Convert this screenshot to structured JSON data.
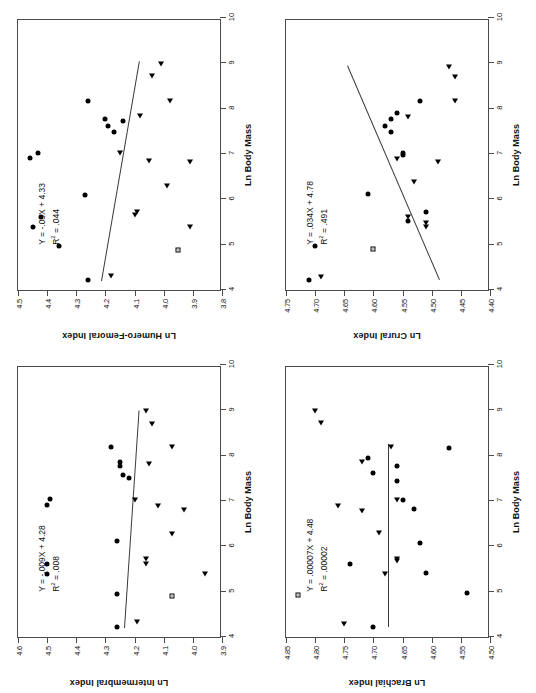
{
  "figure": {
    "background": "#ffffff",
    "ink": "#000000",
    "panel_count": 4,
    "orientation": "rotated-90-ccw"
  },
  "chart_data": [
    {
      "id": "humero-femoral",
      "type": "scatter",
      "position": "top-left",
      "title": "",
      "xlabel": "Ln Body Mass",
      "ylabel": "Ln Humero-Femoral Index",
      "xlim": [
        4,
        10
      ],
      "ylim": [
        3.8,
        4.5
      ],
      "xticks": [
        "4",
        "5",
        "6",
        "7",
        "8",
        "9",
        "10"
      ],
      "yticks": [
        "4.5",
        "4.4",
        "4.3",
        "4.2",
        "4.1",
        "4.0",
        "3.9",
        "3.8"
      ],
      "grid": false,
      "legend": "none",
      "equation": "Y = -.03X + 4.33",
      "r2_label": "R",
      "r2_sup": "2",
      "r2_value": " = .044",
      "fit": {
        "slope": -0.03,
        "intercept": 4.33,
        "r2": 0.044,
        "x_start": 4.2,
        "x_end": 9.05
      },
      "series": [
        {
          "name": "circle",
          "marker": "circle",
          "points": [
            [
              4.23,
              4.26
            ],
            [
              4.97,
              4.36
            ],
            [
              5.38,
              4.45
            ],
            [
              5.62,
              4.42
            ],
            [
              6.1,
              4.27
            ],
            [
              6.92,
              4.46
            ],
            [
              7.03,
              4.43
            ],
            [
              7.48,
              4.17
            ],
            [
              7.62,
              4.19
            ],
            [
              7.78,
              4.2
            ],
            [
              8.18,
              4.26
            ],
            [
              7.72,
              4.14
            ]
          ]
        },
        {
          "name": "triangle",
          "marker": "triangle",
          "points": [
            [
              4.3,
              4.18
            ],
            [
              5.38,
              3.91
            ],
            [
              5.66,
              4.1
            ],
            [
              5.72,
              4.09
            ],
            [
              6.3,
              3.99
            ],
            [
              6.82,
              3.91
            ],
            [
              6.85,
              4.05
            ],
            [
              7.03,
              4.15
            ],
            [
              7.83,
              4.08
            ],
            [
              8.18,
              3.98
            ],
            [
              8.72,
              4.04
            ],
            [
              8.98,
              4.01
            ]
          ]
        },
        {
          "name": "square",
          "marker": "square",
          "points": [
            [
              4.88,
              3.95
            ]
          ]
        }
      ]
    },
    {
      "id": "crural",
      "type": "scatter",
      "position": "top-right",
      "title": "",
      "xlabel": "Ln Body Mass",
      "ylabel": "Ln Crural Index",
      "xlim": [
        4,
        10
      ],
      "ylim": [
        4.4,
        4.75
      ],
      "xticks": [
        "4",
        "5",
        "6",
        "7",
        "8",
        "9",
        "10"
      ],
      "yticks": [
        "4.75",
        "4.70",
        "4.65",
        "4.60",
        "4.55",
        "4.50",
        "4.45",
        "4.40"
      ],
      "grid": false,
      "legend": "none",
      "equation": "Y = .034X + 4.78",
      "r2_label": "R",
      "r2_sup": "2",
      "r2_value": " = .491",
      "fit": {
        "slope": 0.034,
        "intercept": 4.78,
        "r2": 0.491,
        "x_start": 4.22,
        "x_end": 8.95
      },
      "series": [
        {
          "name": "circle",
          "marker": "circle",
          "points": [
            [
              4.22,
              4.71
            ],
            [
              4.98,
              4.7
            ],
            [
              5.52,
              4.54
            ],
            [
              5.72,
              4.51
            ],
            [
              6.12,
              4.61
            ],
            [
              6.98,
              4.55
            ],
            [
              7.03,
              4.55
            ],
            [
              7.48,
              4.57
            ],
            [
              7.62,
              4.58
            ],
            [
              7.78,
              4.57
            ],
            [
              8.18,
              4.52
            ],
            [
              7.9,
              4.56
            ]
          ]
        },
        {
          "name": "triangle",
          "marker": "triangle",
          "points": [
            [
              4.28,
              4.69
            ],
            [
              5.38,
              4.51
            ],
            [
              5.48,
              4.51
            ],
            [
              5.62,
              4.54
            ],
            [
              6.38,
              4.53
            ],
            [
              6.82,
              4.49
            ],
            [
              6.9,
              4.56
            ],
            [
              7.82,
              4.54
            ],
            [
              8.18,
              4.46
            ],
            [
              8.7,
              4.46
            ],
            [
              8.92,
              4.47
            ]
          ]
        },
        {
          "name": "square",
          "marker": "square",
          "points": [
            [
              4.9,
              4.6
            ]
          ]
        }
      ]
    },
    {
      "id": "intermembral",
      "type": "scatter",
      "position": "bottom-left",
      "title": "",
      "xlabel": "Ln Body Mass",
      "ylabel": "Ln Intermembral Index",
      "xlim": [
        4,
        10
      ],
      "ylim": [
        3.9,
        4.6
      ],
      "xticks": [
        "4",
        "5",
        "6",
        "7",
        "8",
        "9",
        "10"
      ],
      "yticks": [
        "4.6",
        "4.5",
        "4.4",
        "4.3",
        "4.2",
        "4.1",
        "4.0",
        "3.9"
      ],
      "grid": false,
      "legend": "none",
      "equation": "Y = -.009X + 4.28",
      "r2_label": "R",
      "r2_sup": "2",
      "r2_value": " = .008",
      "fit": {
        "slope": -0.009,
        "intercept": 4.28,
        "r2": 0.008,
        "x_start": 4.2,
        "x_end": 9.0
      },
      "series": [
        {
          "name": "circle",
          "marker": "circle",
          "points": [
            [
              4.22,
              4.26
            ],
            [
              4.95,
              4.26
            ],
            [
              5.38,
              4.5
            ],
            [
              5.62,
              4.5
            ],
            [
              6.12,
              4.26
            ],
            [
              6.92,
              4.5
            ],
            [
              7.05,
              4.49
            ],
            [
              7.5,
              4.22
            ],
            [
              7.58,
              4.24
            ],
            [
              7.78,
              4.25
            ],
            [
              7.85,
              4.25
            ],
            [
              8.2,
              4.28
            ]
          ]
        },
        {
          "name": "triangle",
          "marker": "triangle",
          "points": [
            [
              4.32,
              4.19
            ],
            [
              5.4,
              3.96
            ],
            [
              5.62,
              4.16
            ],
            [
              5.72,
              4.16
            ],
            [
              6.28,
              4.07
            ],
            [
              6.8,
              4.03
            ],
            [
              6.88,
              4.12
            ],
            [
              7.03,
              4.2
            ],
            [
              7.82,
              4.15
            ],
            [
              8.2,
              4.07
            ],
            [
              8.7,
              4.14
            ],
            [
              8.98,
              4.16
            ]
          ]
        },
        {
          "name": "square",
          "marker": "square",
          "points": [
            [
              4.9,
              4.07
            ]
          ]
        }
      ]
    },
    {
      "id": "brachial",
      "type": "scatter",
      "position": "bottom-right",
      "title": "",
      "xlabel": "Ln Body Mass",
      "ylabel": "Ln Brachial Index",
      "xlim": [
        4,
        10
      ],
      "ylim": [
        4.5,
        4.85
      ],
      "xticks": [
        "4",
        "5",
        "6",
        "7",
        "8",
        "9",
        "10"
      ],
      "yticks": [
        "4.85",
        "4.80",
        "4.75",
        "4.70",
        "4.65",
        "4.60",
        "4.55",
        "4.50"
      ],
      "grid": false,
      "legend": "none",
      "equation": "Y = .00007X + 4.48",
      "r2_label": "R",
      "r2_sup": "2",
      "r2_value": " = .00002",
      "fit": {
        "slope": 7e-05,
        "intercept": 4.675,
        "r2": 2e-05,
        "x_start": 4.22,
        "x_end": 8.25
      },
      "series": [
        {
          "name": "circle",
          "marker": "circle",
          "points": [
            [
              4.22,
              4.7
            ],
            [
              4.98,
              4.54
            ],
            [
              5.42,
              4.61
            ],
            [
              5.62,
              4.74
            ],
            [
              6.08,
              4.62
            ],
            [
              6.82,
              4.63
            ],
            [
              7.02,
              4.65
            ],
            [
              7.45,
              4.66
            ],
            [
              7.62,
              4.7
            ],
            [
              7.78,
              4.66
            ],
            [
              7.95,
              4.71
            ],
            [
              8.18,
              4.57
            ]
          ]
        },
        {
          "name": "triangle",
          "marker": "triangle",
          "points": [
            [
              4.28,
              4.75
            ],
            [
              5.38,
              4.68
            ],
            [
              5.68,
              4.66
            ],
            [
              5.72,
              4.66
            ],
            [
              6.3,
              4.69
            ],
            [
              6.78,
              4.72
            ],
            [
              6.88,
              4.76
            ],
            [
              7.03,
              4.66
            ],
            [
              7.85,
              4.72
            ],
            [
              8.2,
              4.67
            ],
            [
              8.72,
              4.79
            ],
            [
              8.98,
              4.8
            ]
          ]
        },
        {
          "name": "square",
          "marker": "square",
          "points": [
            [
              4.92,
              4.83
            ]
          ]
        }
      ]
    }
  ]
}
